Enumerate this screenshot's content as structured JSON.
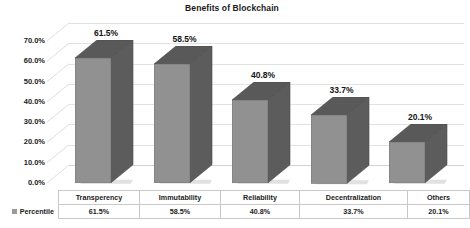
{
  "chart_data": {
    "type": "bar",
    "title": "Benefits of Blockchain",
    "xlabel": "",
    "ylabel": "",
    "ylim": [
      0,
      70
    ],
    "grid": true,
    "legend_position": "left-bottom",
    "categories": [
      "Transperency",
      "Immutability",
      "Reliability",
      "Decentralization",
      "Others"
    ],
    "series": [
      {
        "name": "Percentile",
        "values": [
          61.5,
          58.5,
          40.8,
          33.7,
          20.1
        ],
        "value_labels": [
          "61.5%",
          "58.5%",
          "40.8%",
          "33.7%",
          "20.1%"
        ]
      }
    ],
    "y_tick_labels": [
      "70.0%",
      "60.0%",
      "50.0%",
      "40.0%",
      "30.0%",
      "20.0%",
      "10.0%",
      "0.0%"
    ],
    "y_tick_values": [
      70,
      60,
      50,
      40,
      30,
      20,
      10,
      0
    ],
    "colors": {
      "bar_front": "#919191",
      "bar_top": "#5c5c5c",
      "bar_side": "#5c5c5c",
      "gridline": "#e2e2e2",
      "text": "#1a1a1a",
      "table_border": "#c9c9c9",
      "legend_swatch": "#9a9a9a"
    }
  },
  "table": {
    "legend_label": "Percentile",
    "header_row": [
      "Transperency",
      "Immutability",
      "Reliability",
      "Decentralization",
      "Others"
    ],
    "value_row": [
      "61.5%",
      "58.5%",
      "40.8%",
      "33.7%",
      "20.1%"
    ]
  }
}
